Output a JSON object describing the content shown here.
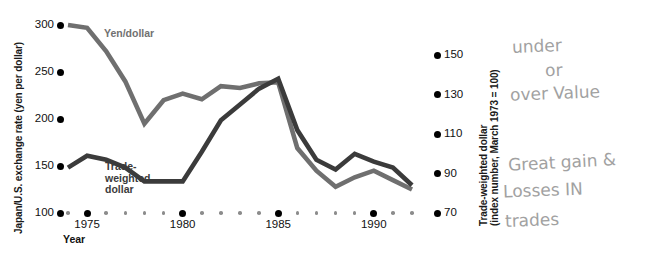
{
  "chart_data": {
    "type": "line",
    "title": "",
    "xlabel": "Year",
    "ylabel": "Japan/U.S. exchange rate (yen per dollar)",
    "y2label": "Trade-weighted dollar (index number, March 1973 = 100)",
    "grid": false,
    "legend_position": "inline-labels",
    "xlim": [
      1974,
      1992
    ],
    "ylim": [
      100,
      300
    ],
    "y2lim": [
      70,
      150
    ],
    "xticks_major": [
      "1975",
      "1980",
      "1985",
      "1990"
    ],
    "yticks": [
      "100",
      "150",
      "200",
      "250",
      "300"
    ],
    "y2ticks": [
      "70",
      "90",
      "110",
      "130",
      "150"
    ],
    "x": [
      1974,
      1975,
      1976,
      1977,
      1978,
      1979,
      1980,
      1981,
      1982,
      1983,
      1984,
      1985,
      1986,
      1987,
      1988,
      1989,
      1990,
      1991,
      1992
    ],
    "series": [
      {
        "name": "Yen/dollar",
        "axis": "left",
        "color": "#6f6f6f",
        "values": [
          300,
          297,
          272,
          240,
          195,
          220,
          227,
          221,
          235,
          233,
          238,
          239,
          169,
          145,
          128,
          138,
          145,
          135,
          125
        ]
      },
      {
        "name": "Trade-weighted dollar",
        "axis": "right",
        "color": "#3b3b3b",
        "values": [
          93,
          99,
          97,
          93,
          86,
          86,
          86,
          101,
          117,
          125,
          133,
          138,
          112,
          97,
          92,
          100,
          96,
          93,
          84
        ]
      }
    ]
  },
  "axes": {
    "left_title": "Japan/U.S. exchange rate (yen per dollar)",
    "right_title_line1": "Trade-weighted dollar",
    "right_title_line2": "(index number, March 1973 = 100)",
    "x_title": "Year"
  },
  "labels": {
    "yen_series": "Yen/dollar",
    "twd_series": "Trade-\nweighted\ndollar"
  },
  "annotations": {
    "note1": "under",
    "note2": "or",
    "note3": "over Value",
    "note4": "Great gain &",
    "note5": "Losses IN",
    "note6": "trades"
  },
  "colors": {
    "yen_line": "#6f6f6f",
    "twd_line": "#3b3b3b",
    "tick_dot": "#000000",
    "background": "#ffffff",
    "handwriting": "#9a9a9a"
  }
}
